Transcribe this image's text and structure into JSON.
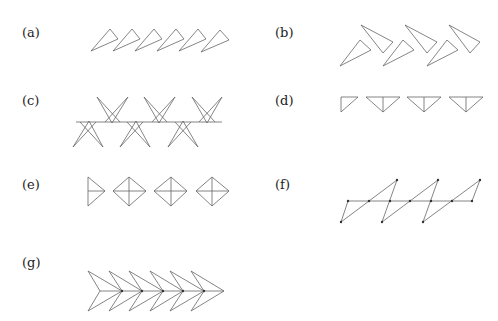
{
  "panels": [
    {
      "id": "a",
      "label": "(a)",
      "description": "Six thin triangles in a row, all same orientation (translation)"
    },
    {
      "id": "b",
      "label": "(b)",
      "description": "Three pairs of triangles, each pair one triangle and its rotated copy"
    },
    {
      "id": "c",
      "label": "(c)",
      "description": "Star-like crossed shapes alternating above and below a horizontal line"
    },
    {
      "id": "d",
      "label": "(d)",
      "description": "Half triangle followed by three inverted triangles with vertical axis"
    },
    {
      "id": "e",
      "label": "(e)",
      "description": "Half diamond followed by three diamonds with cross diagonals"
    },
    {
      "id": "f",
      "label": "(f)",
      "description": "Zig-zag triangles across a horizontal line with marked vertices"
    },
    {
      "id": "g",
      "label": "(g)",
      "description": "Six nested chevron/arrowheads along a horizontal axis"
    }
  ],
  "colors": {
    "stroke": "#666666",
    "text": "#222222",
    "background": "#ffffff"
  }
}
